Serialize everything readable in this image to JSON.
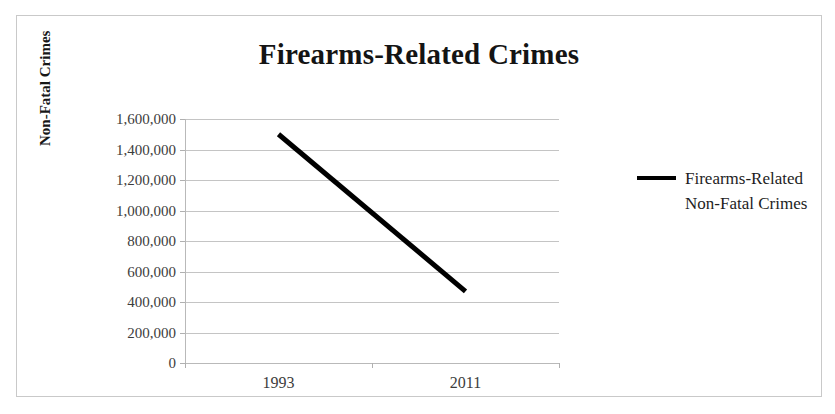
{
  "chart_data": {
    "type": "line",
    "title": "Firearms-Related Crimes",
    "xlabel": "",
    "ylabel": "Non-Fatal Crimes",
    "categories": [
      "1993",
      "2011"
    ],
    "series": [
      {
        "name": "Firearms-Related Non-Fatal Crimes",
        "values": [
          1500000,
          470000
        ],
        "color": "#000000"
      }
    ],
    "ylim": [
      0,
      1600000
    ],
    "ytick_values": [
      0,
      200000,
      400000,
      600000,
      800000,
      1000000,
      1200000,
      1400000,
      1600000
    ],
    "ytick_labels": [
      "0",
      "200,000",
      "400,000",
      "600,000",
      "800,000",
      "1,000,000",
      "1,200,000",
      "1,400,000",
      "1,600,000"
    ],
    "grid": true,
    "grid_axis": "y",
    "legend_position": "right",
    "legend_entries": [
      "Firearms-Related Non-Fatal Crimes"
    ]
  },
  "colors": {
    "series_line": "#000000",
    "gridline": "#c4c4c4",
    "axis_line": "#b9b9b9",
    "frame_border": "#c9c9c9",
    "title_text": "#141414",
    "tick_text": "#3c3c3c",
    "background": "#ffffff"
  },
  "legend": {
    "swatch_name": "line-swatch",
    "label": "Firearms-Related Non-Fatal Crimes"
  }
}
